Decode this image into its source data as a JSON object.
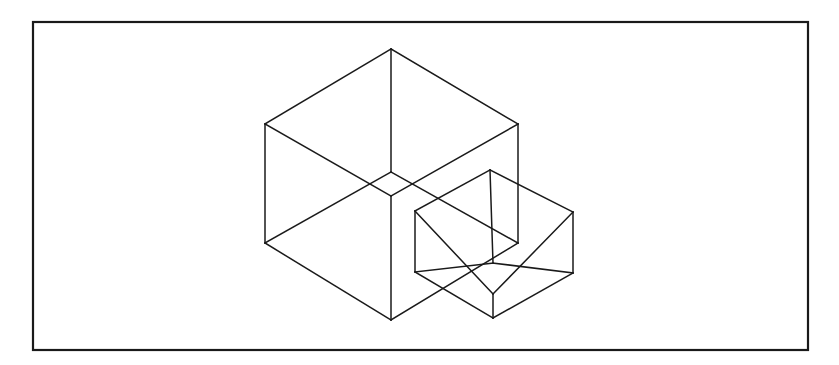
{
  "figure": {
    "background_color": "#ffffff",
    "ink_color": "#1a1a1a",
    "frame": {
      "name": "border-rectangle",
      "x": 33,
      "y": 22,
      "width": 775,
      "height": 328,
      "stroke_color": "#1a1a1a",
      "stroke_width": 2.2,
      "fill_color": "#ffffff"
    },
    "shapes": [
      {
        "name": "large-cube",
        "label": "Large wireframe cube",
        "stroke_color": "#1a1a1a",
        "stroke_width": 1.5,
        "vertices": {
          "top": [
            391,
            49
          ],
          "upper_left": [
            265,
            124
          ],
          "upper_right": [
            518,
            124
          ],
          "front_top": [
            391,
            172
          ],
          "back_bottom": [
            391,
            196
          ],
          "lower_left": [
            265,
            243
          ],
          "lower_right": [
            518,
            243
          ],
          "front_bottom": [
            391,
            320
          ]
        },
        "edges": [
          [
            [
              265,
              124
            ],
            [
              391,
              49
            ]
          ],
          [
            [
              391,
              49
            ],
            [
              518,
              124
            ]
          ],
          [
            [
              265,
              124
            ],
            [
              391,
              196
            ]
          ],
          [
            [
              518,
              124
            ],
            [
              391,
              196
            ]
          ],
          [
            [
              391,
              49
            ],
            [
              391,
              172
            ]
          ],
          [
            [
              265,
              124
            ],
            [
              265,
              243
            ]
          ],
          [
            [
              518,
              124
            ],
            [
              518,
              243
            ]
          ],
          [
            [
              391,
              196
            ],
            [
              391,
              320
            ]
          ],
          [
            [
              265,
              243
            ],
            [
              391,
              172
            ]
          ],
          [
            [
              518,
              243
            ],
            [
              391,
              172
            ]
          ],
          [
            [
              265,
              243
            ],
            [
              391,
              320
            ]
          ],
          [
            [
              391,
              320
            ],
            [
              518,
              243
            ]
          ]
        ]
      },
      {
        "name": "small-cube",
        "label": "Small wireframe cube",
        "stroke_color": "#1a1a1a",
        "stroke_width": 1.5,
        "vertices": {
          "top": [
            490,
            170
          ],
          "upper_left": [
            415,
            211
          ],
          "upper_right": [
            573,
            212
          ],
          "front_top": [
            493,
            263
          ],
          "back_bottom": [
            493,
            294
          ],
          "lower_left": [
            415,
            272
          ],
          "lower_right": [
            573,
            273
          ],
          "front_bottom": [
            493,
            318
          ]
        },
        "edges": [
          [
            [
              415,
              211
            ],
            [
              490,
              170
            ]
          ],
          [
            [
              490,
              170
            ],
            [
              573,
              212
            ]
          ],
          [
            [
              415,
              211
            ],
            [
              493,
              294
            ]
          ],
          [
            [
              573,
              212
            ],
            [
              493,
              294
            ]
          ],
          [
            [
              490,
              170
            ],
            [
              493,
              263
            ]
          ],
          [
            [
              415,
              211
            ],
            [
              415,
              272
            ]
          ],
          [
            [
              573,
              212
            ],
            [
              573,
              273
            ]
          ],
          [
            [
              493,
              294
            ],
            [
              493,
              318
            ]
          ],
          [
            [
              415,
              272
            ],
            [
              493,
              263
            ]
          ],
          [
            [
              573,
              273
            ],
            [
              493,
              263
            ]
          ],
          [
            [
              415,
              272
            ],
            [
              493,
              318
            ]
          ],
          [
            [
              493,
              318
            ],
            [
              573,
              273
            ]
          ]
        ]
      }
    ]
  }
}
